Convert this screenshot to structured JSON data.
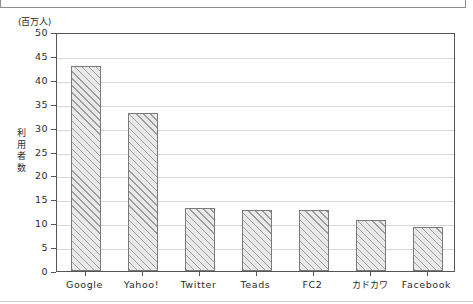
{
  "chart_data": {
    "type": "bar",
    "title": "",
    "subtitle": "",
    "unit_label": "(百万人)",
    "xlabel": "",
    "ylabel": "利用者数",
    "ylabel_chars": [
      "利",
      "用",
      "者",
      "数"
    ],
    "categories": [
      "Google",
      "Yahoo!",
      "Twitter",
      "Teads",
      "FC2",
      "カドカワ",
      "Facebook"
    ],
    "values": [
      42.9,
      33.1,
      13.2,
      12.8,
      12.8,
      10.7,
      9.2
    ],
    "ylim": [
      0,
      50
    ],
    "ytick_labels": [
      "50",
      "45",
      "40",
      "35",
      "30",
      "25",
      "20",
      "15",
      "10",
      "5",
      "0"
    ],
    "ytick_values": [
      50,
      45,
      40,
      35,
      30,
      25,
      20,
      15,
      10,
      5,
      0
    ],
    "grid": true,
    "grid_axis": "y",
    "legend": "none",
    "bar_fill": "#e9e9e9",
    "bar_hatch": "diagonal",
    "bar_edge_color": "#7a7a7a",
    "grid_color": "#d6d6d6",
    "axis_color": "#555555"
  },
  "top_panel": {
    "present": true,
    "tab_label": ""
  }
}
